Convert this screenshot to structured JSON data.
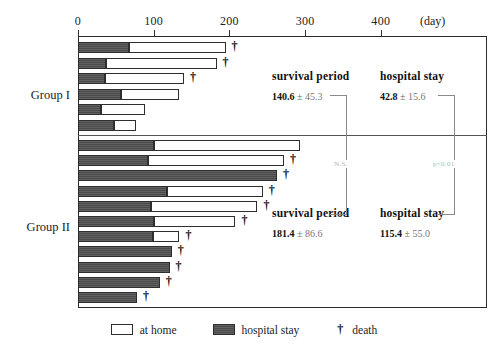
{
  "chart_data": {
    "type": "bar",
    "title": "",
    "xlabel": "(day)",
    "ylabel": "",
    "orientation": "horizontal",
    "stacked": true,
    "grid": false,
    "xlim": [
      0,
      540
    ],
    "xticks": [
      0,
      100,
      200,
      300,
      400
    ],
    "xtick_labels": [
      "0",
      "100",
      "200",
      "300",
      "400"
    ],
    "legend": {
      "position": "bottom",
      "entries": [
        {
          "label": "at home",
          "marker": "open-rect",
          "color": "#ffffff"
        },
        {
          "label": "hospital stay",
          "marker": "filled-rect",
          "color": "#4a4a4a"
        },
        {
          "label": "death",
          "marker": "dagger",
          "glyph": "†"
        }
      ]
    },
    "series": [
      {
        "name": "hospital stay",
        "color": "#4a4a4a"
      },
      {
        "name": "at home",
        "color": "#ffffff"
      }
    ],
    "groups": [
      {
        "name": "Group I",
        "bars": [
          {
            "hospital_stay": 67,
            "at_home": 128,
            "total": 195,
            "death": true
          },
          {
            "hospital_stay": 37,
            "at_home": 146,
            "total": 183,
            "death": true
          },
          {
            "hospital_stay": 36,
            "at_home": 104,
            "total": 140,
            "death": true
          },
          {
            "hospital_stay": 57,
            "at_home": 77,
            "total": 134,
            "death": false
          },
          {
            "hospital_stay": 30,
            "at_home": 58,
            "total": 88,
            "death": false
          },
          {
            "hospital_stay": 47,
            "at_home": 30,
            "total": 77,
            "death": false
          }
        ]
      },
      {
        "name": "Group II",
        "bars": [
          {
            "hospital_stay": 100,
            "at_home": 193,
            "total": 293,
            "death": false
          },
          {
            "hospital_stay": 92,
            "at_home": 180,
            "total": 272,
            "death": true
          },
          {
            "hospital_stay": 263,
            "at_home": 0,
            "total": 263,
            "death": true
          },
          {
            "hospital_stay": 118,
            "at_home": 126,
            "total": 244,
            "death": true
          },
          {
            "hospital_stay": 97,
            "at_home": 140,
            "total": 237,
            "death": true
          },
          {
            "hospital_stay": 100,
            "at_home": 108,
            "total": 208,
            "death": true
          },
          {
            "hospital_stay": 99,
            "at_home": 35,
            "total": 134,
            "death": true
          },
          {
            "hospital_stay": 124,
            "at_home": 0,
            "total": 124,
            "death": true
          },
          {
            "hospital_stay": 121,
            "at_home": 0,
            "total": 121,
            "death": true
          },
          {
            "hospital_stay": 108,
            "at_home": 0,
            "total": 108,
            "death": true
          },
          {
            "hospital_stay": 78,
            "at_home": 0,
            "total": 78,
            "death": true
          }
        ]
      }
    ],
    "annotations": [
      {
        "group": "Group I",
        "metric": "survival period",
        "mean": "140.6",
        "sd": "45.3",
        "text": "140.6 ± 45.3"
      },
      {
        "group": "Group I",
        "metric": "hospital stay",
        "mean": "42.8",
        "sd": "15.6",
        "text": "42.8 ± 15.6"
      },
      {
        "group": "Group II",
        "metric": "survival period",
        "mean": "181.4",
        "sd": "86.6",
        "text": "181.4 ± 86.6"
      },
      {
        "group": "Group II",
        "metric": "hospital stay",
        "mean": "115.4",
        "sd": "55.0",
        "text": "115.4 ± 55.0"
      }
    ],
    "significance": [
      {
        "metric": "survival period",
        "label": "N.S."
      },
      {
        "metric": "hospital stay",
        "label": "p<0.01"
      }
    ]
  },
  "axis": {
    "unit_label": "(day)",
    "ticks": [
      "0",
      "100",
      "200",
      "300",
      "400"
    ]
  },
  "groups": {
    "g1_label": "Group I",
    "g2_label": "Group II"
  },
  "stats": {
    "g1": {
      "survival_title": "survival period",
      "survival_mean": "140.6",
      "survival_pm": "±",
      "survival_sd": "45.3",
      "hospital_title": "hospital  stay",
      "hospital_mean": "42.8",
      "hospital_pm": "±",
      "hospital_sd": "15.6"
    },
    "g2": {
      "survival_title": "survival period",
      "survival_mean": "181.4",
      "survival_pm": "±",
      "survival_sd": "86.6",
      "hospital_title": "hospital stay",
      "hospital_mean": "115.4",
      "hospital_pm": "±",
      "hospital_sd": "55.0"
    }
  },
  "significance": {
    "survival_label": "N.S.",
    "hospital_label": "p<0.01"
  },
  "legend": {
    "home_label": "at home",
    "hospital_label": "hospital stay",
    "death_glyph": "†",
    "death_label": "death"
  },
  "marks": {
    "dagger": "†"
  },
  "colors": {
    "hospital_fill": "#4a4a4a",
    "home_fill": "#ffffff",
    "stroke": "#2e2e2e",
    "axis": "#2b2b2b",
    "sig": "#b4b4b4"
  },
  "geometry": {
    "x0_px": 78,
    "px_per_day": 0.757,
    "bar_height_px": 11,
    "g1_first_top_px": 42,
    "g1_row_pitch_px": 15.5,
    "g2_first_top_px": 140,
    "g2_row_pitch_px": 15.2
  }
}
